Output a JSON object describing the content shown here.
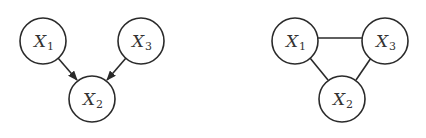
{
  "graphs": [
    {
      "type": "directed",
      "nodes": [
        {
          "id": "X1",
          "var": "X",
          "sub": "1",
          "cx": 43,
          "cy": 41
        },
        {
          "id": "X3",
          "var": "X",
          "sub": "3",
          "cx": 141,
          "cy": 41
        },
        {
          "id": "X2",
          "var": "X",
          "sub": "2",
          "cx": 92,
          "cy": 99
        }
      ],
      "edges": [
        {
          "from": "X1",
          "to": "X2",
          "directed": true
        },
        {
          "from": "X3",
          "to": "X2",
          "directed": true
        }
      ]
    },
    {
      "type": "undirected",
      "nodes": [
        {
          "id": "X1",
          "var": "X",
          "sub": "1",
          "cx": 295,
          "cy": 41
        },
        {
          "id": "X3",
          "var": "X",
          "sub": "3",
          "cx": 385,
          "cy": 41
        },
        {
          "id": "X2",
          "var": "X",
          "sub": "2",
          "cx": 342,
          "cy": 99
        }
      ],
      "edges": [
        {
          "from": "X1",
          "to": "X3",
          "directed": false
        },
        {
          "from": "X1",
          "to": "X2",
          "directed": false
        },
        {
          "from": "X3",
          "to": "X2",
          "directed": false
        }
      ]
    }
  ],
  "style": {
    "stroke": "#2a2a2a",
    "node_radius": 23
  }
}
